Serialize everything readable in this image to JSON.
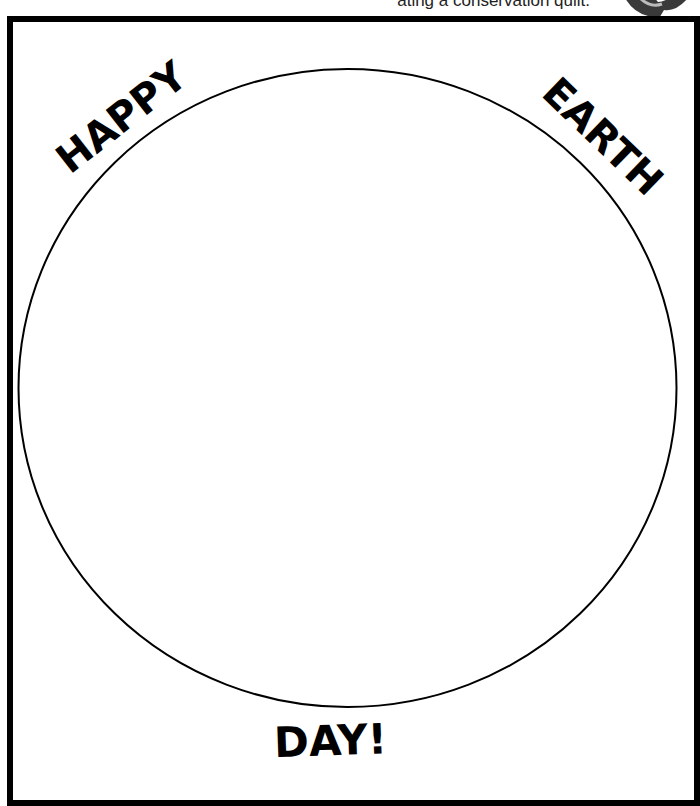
{
  "header": {
    "cut_off_caption": "ating a conservation quilt.",
    "logo_icon": "recycle-icon"
  },
  "worksheet": {
    "words": {
      "happy": "HAPPY",
      "earth": "EARTH",
      "day": "DAY!"
    },
    "circle": {
      "purpose": "blank drawing area"
    }
  },
  "colors": {
    "ink": "#000000",
    "paper": "#ffffff",
    "logo_gray": "#3a3a3a"
  }
}
